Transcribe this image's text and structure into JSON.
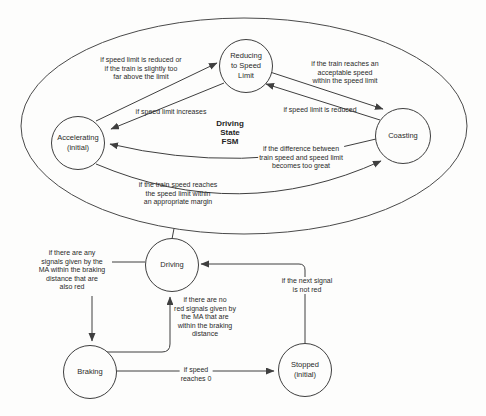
{
  "colors": {
    "background": "#fdfdfc",
    "line": "#3f3f3f",
    "text": "#2a2a2a"
  },
  "fsm": {
    "title": "Driving\nState\nFSM",
    "states": [
      {
        "id": "reducing",
        "name": "Reducing\nto Speed\nLimit"
      },
      {
        "id": "accelerating",
        "name": "Accelerating\n(initial)"
      },
      {
        "id": "coasting",
        "name": "Coasting"
      },
      {
        "id": "driving",
        "name": "Driving"
      },
      {
        "id": "braking",
        "name": "Braking"
      },
      {
        "id": "stopped",
        "name": "Stopped\n(initial)"
      }
    ],
    "transitions": [
      {
        "from": "Accelerating",
        "to": "Reducing to Speed Limit",
        "label": "if speed limit is reduced or\nif the train is slightly too\nfar above the limit"
      },
      {
        "from": "Reducing to Speed Limit",
        "to": "Accelerating",
        "label": "if speed limit increases"
      },
      {
        "from": "Reducing to Speed Limit",
        "to": "Coasting",
        "label": "if the train reaches an\nacceptable speed\nwithin the speed limit"
      },
      {
        "from": "Coasting",
        "to": "Reducing to Speed Limit",
        "label": "if speed limit is reduced"
      },
      {
        "from": "Coasting",
        "to": "Accelerating",
        "label": "if the difference between\ntrain speed and speed limit\nbecomes too great"
      },
      {
        "from": "Accelerating",
        "to": "Coasting",
        "label": "if the train speed reaches\nthe speed limit within\nan appropriate margin"
      },
      {
        "from": "Driving",
        "to": "Braking",
        "label": "if there are any\nsignals given by the\nMA within the braking\ndistance that are\nalso red"
      },
      {
        "from": "Braking",
        "to": "Driving",
        "label": "if there are no\nred signals given by\nthe MA that are\nwithin the braking\ndistance"
      },
      {
        "from": "Stopped",
        "to": "Driving",
        "label": "if the next signal\nis not red"
      },
      {
        "from": "Braking",
        "to": "Stopped",
        "label": "if speed\nreaches 0"
      }
    ]
  }
}
